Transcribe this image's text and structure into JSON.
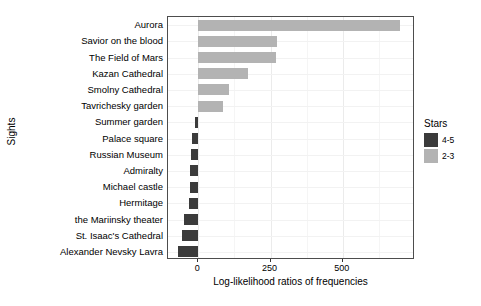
{
  "chart_data": {
    "type": "bar",
    "orientation": "horizontal",
    "title": "",
    "xlabel": "Log-likelihood ratios of frequencies",
    "ylabel": "Sights",
    "xlim": [
      -105,
      750
    ],
    "xticks": [
      0,
      250,
      500
    ],
    "xtick_labels": [
      "0",
      "250",
      "500"
    ],
    "grid": true,
    "legend": {
      "title": "Stars",
      "position": "right",
      "entries": [
        {
          "label": "4-5",
          "color": "#3b3b3b"
        },
        {
          "label": "2-3",
          "color": "#b3b3b3"
        }
      ]
    },
    "categories": [
      "Aurora",
      "Savior on the blood",
      "The Field of Mars",
      "Kazan Cathedral",
      "Smolny Cathedral",
      "Tavrichesky garden",
      "Summer garden",
      "Palace square",
      "Russian Museum",
      "Admiralty",
      "Michael castle",
      "Hermitage",
      "the Mariinsky theater",
      "St. Isaac's Cathedral",
      "Alexander Nevsky Lavra"
    ],
    "values": [
      698,
      271,
      270,
      171,
      107,
      85,
      -10,
      -22,
      -26,
      -28,
      -30,
      -33,
      -48,
      -55,
      -70
    ],
    "groups": [
      "2-3",
      "2-3",
      "2-3",
      "2-3",
      "2-3",
      "2-3",
      "4-5",
      "4-5",
      "4-5",
      "4-5",
      "4-5",
      "4-5",
      "4-5",
      "4-5",
      "4-5"
    ]
  }
}
